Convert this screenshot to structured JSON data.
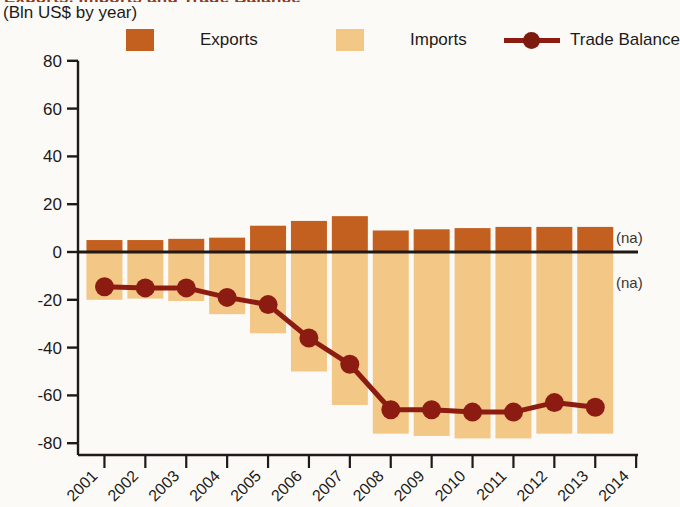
{
  "title": "Exports, Imports and Trade Balance",
  "axis_unit_label": "(Bln US$ by year)",
  "legend": {
    "exports": "Exports",
    "imports": "Imports",
    "balance": "Trade Balance"
  },
  "annotations": {
    "na_above": "(na)",
    "na_below": "(na)"
  },
  "colors": {
    "exports": "#c4601f",
    "imports": "#f3c887",
    "balance": "#8c1c12",
    "axis": "#1d1a18",
    "background": "#fbfaf7"
  },
  "chart_data": {
    "type": "bar",
    "title": "Exports, Imports and Trade Balance",
    "subtitle": "(Bln US$ by year)",
    "xlabel": "",
    "ylabel": "Bln US$ by year",
    "ylim": [
      -80,
      80
    ],
    "yticks": [
      80,
      60,
      40,
      20,
      0,
      -20,
      -40,
      -60,
      -80
    ],
    "ytick_labels": [
      "80",
      "60",
      "40",
      "20",
      "0",
      "-20",
      "-40",
      "-60",
      "-80"
    ],
    "x": [
      "2001",
      "2002",
      "2003",
      "2004",
      "2005",
      "2006",
      "2007",
      "2008",
      "2009",
      "2010",
      "2011",
      "2012",
      "2013",
      "2014"
    ],
    "xtick_labels": [
      "2001",
      "2002",
      "2003",
      "2004",
      "2005",
      "2006",
      "2007",
      "2008",
      "2009",
      "2010",
      "2011",
      "2012",
      "2013",
      "2014"
    ],
    "categories": [
      "2001",
      "2002",
      "2003",
      "2004",
      "2005",
      "2006",
      "2007",
      "2008",
      "2009",
      "2010",
      "2011",
      "2012",
      "2013"
    ],
    "grid": false,
    "legend_position": "top",
    "series": [
      {
        "name": "Exports",
        "type": "bar",
        "color": "#c4601f",
        "values": [
          5,
          5,
          5.5,
          6,
          11,
          13,
          15,
          9,
          9.5,
          10,
          10.5,
          10.5,
          10.5
        ]
      },
      {
        "name": "Imports",
        "type": "bar",
        "color": "#f3c887",
        "values": [
          -20,
          -19.5,
          -20.5,
          -26,
          -34,
          -50,
          -64,
          -76,
          -77,
          -78,
          -78,
          -76,
          -76
        ]
      },
      {
        "name": "Trade Balance",
        "type": "line",
        "color": "#8c1c12",
        "values": [
          -14.5,
          -15,
          -15,
          -19,
          -22,
          -36,
          -47,
          -66,
          -66,
          -67,
          -67,
          -63,
          -65
        ]
      }
    ],
    "notes": [
      "(na)",
      "(na)"
    ]
  }
}
